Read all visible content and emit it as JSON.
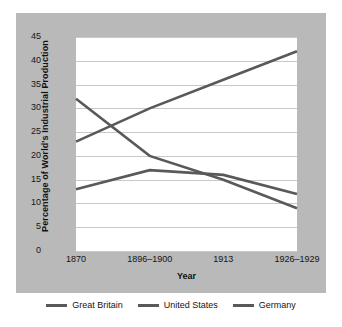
{
  "chart_data": {
    "type": "line",
    "title": "",
    "xlabel": "Year",
    "ylabel": "Percentage of World's Industrial Production",
    "categories": [
      "1870",
      "1896–1900",
      "1913",
      "1926–1929"
    ],
    "yticks": [
      "0",
      "5",
      "10",
      "15",
      "20",
      "25",
      "30",
      "35",
      "40",
      "45"
    ],
    "ylim": [
      0,
      45
    ],
    "grid": "horizontal",
    "legend_position": "bottom",
    "series": [
      {
        "name": "Great Britain",
        "values": [
          32,
          20,
          15,
          9
        ],
        "color": "#595959"
      },
      {
        "name": "United States",
        "values": [
          23,
          30,
          36,
          42
        ],
        "color": "#595959"
      },
      {
        "name": "Germany",
        "values": [
          13,
          17,
          16,
          12
        ],
        "color": "#595959"
      }
    ]
  },
  "legend": {
    "items": [
      {
        "label": "Great Britain",
        "swatch": "line-swatch-great-britain"
      },
      {
        "label": "United States",
        "swatch": "line-swatch-united-states"
      },
      {
        "label": "Germany",
        "swatch": "line-swatch-germany"
      }
    ]
  }
}
